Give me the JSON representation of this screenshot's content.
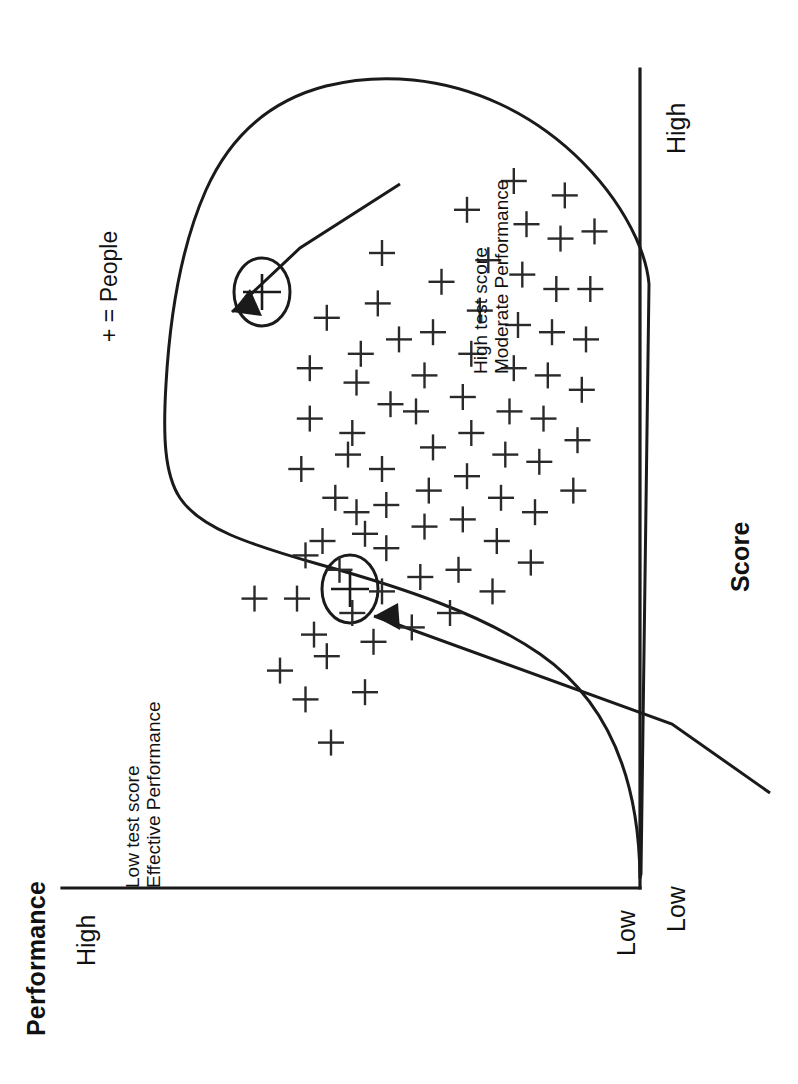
{
  "figure": {
    "orientation": "rotated-90-ccw",
    "background": "#ffffff",
    "ink_color": "#1a1a1a"
  },
  "axes": {
    "y_title": "Performance",
    "x_title": "Score",
    "y_ticks": [
      "High",
      "Low"
    ],
    "x_ticks": [
      "Low",
      "High"
    ]
  },
  "legend": {
    "marker": "+",
    "text": "+ = People"
  },
  "annotations": [
    {
      "id": "low-test-score",
      "line1": "Low test score",
      "line2": "Effective Performance",
      "text": "Low test score\nEffective Performance"
    },
    {
      "id": "high-test-score",
      "line1": "High test score",
      "line2": "Moderate Performance",
      "text": "High test score\nModerate Performance"
    }
  ],
  "chart_data": {
    "type": "scatter",
    "title": "",
    "xlabel": "Score",
    "ylabel": "Performance",
    "xlim": [
      0,
      1
    ],
    "ylim": [
      0,
      1
    ],
    "xtick_labels": [
      "Low",
      "High"
    ],
    "ytick_labels": [
      "Low",
      "High"
    ],
    "grid": false,
    "legend": "+ = People",
    "marker": "plus",
    "series": [
      {
        "name": "People",
        "marker": "+",
        "points": [
          [
            0.32,
            0.86
          ],
          [
            0.22,
            0.8
          ],
          [
            0.32,
            0.76
          ],
          [
            0.38,
            0.74
          ],
          [
            0.5,
            0.75
          ],
          [
            0.57,
            0.73
          ],
          [
            0.12,
            0.68
          ],
          [
            0.24,
            0.69
          ],
          [
            0.36,
            0.66
          ],
          [
            0.4,
            0.7
          ],
          [
            0.46,
            0.67
          ],
          [
            0.64,
            0.73
          ],
          [
            0.71,
            0.69
          ],
          [
            0.19,
            0.6
          ],
          [
            0.26,
            0.58
          ],
          [
            0.33,
            0.56
          ],
          [
            0.39,
            0.55
          ],
          [
            0.45,
            0.55
          ],
          [
            0.5,
            0.56
          ],
          [
            0.55,
            0.63
          ],
          [
            0.62,
            0.62
          ],
          [
            0.66,
            0.61
          ],
          [
            0.73,
            0.57
          ],
          [
            0.8,
            0.56
          ],
          [
            0.28,
            0.49
          ],
          [
            0.35,
            0.47
          ],
          [
            0.42,
            0.46
          ],
          [
            0.47,
            0.45
          ],
          [
            0.53,
            0.44
          ],
          [
            0.58,
            0.48
          ],
          [
            0.63,
            0.46
          ],
          [
            0.69,
            0.44
          ],
          [
            0.76,
            0.42
          ],
          [
            0.3,
            0.4
          ],
          [
            0.36,
            0.38
          ],
          [
            0.43,
            0.37
          ],
          [
            0.49,
            0.36
          ],
          [
            0.55,
            0.35
          ],
          [
            0.6,
            0.37
          ],
          [
            0.66,
            0.35
          ],
          [
            0.72,
            0.33
          ],
          [
            0.79,
            0.31
          ],
          [
            0.33,
            0.3
          ],
          [
            0.4,
            0.29
          ],
          [
            0.46,
            0.28
          ],
          [
            0.52,
            0.27
          ],
          [
            0.58,
            0.26
          ],
          [
            0.64,
            0.25
          ],
          [
            0.7,
            0.24
          ],
          [
            0.77,
            0.23
          ],
          [
            0.84,
            0.22
          ],
          [
            0.37,
            0.21
          ],
          [
            0.44,
            0.2
          ],
          [
            0.51,
            0.19
          ],
          [
            0.57,
            0.18
          ],
          [
            0.63,
            0.17
          ],
          [
            0.69,
            0.16
          ],
          [
            0.75,
            0.15
          ],
          [
            0.82,
            0.14
          ],
          [
            0.88,
            0.13
          ],
          [
            0.47,
            0.11
          ],
          [
            0.54,
            0.1
          ],
          [
            0.61,
            0.09
          ],
          [
            0.68,
            0.08
          ],
          [
            0.75,
            0.07
          ],
          [
            0.83,
            0.06
          ],
          [
            0.41,
            0.6
          ],
          [
            0.59,
            0.54
          ],
          [
            0.44,
            0.62
          ],
          [
            0.68,
            0.52
          ],
          [
            0.86,
            0.36
          ],
          [
            0.9,
            0.25
          ],
          [
            0.52,
            0.64
          ],
          [
            0.3,
            0.63
          ],
          [
            0.27,
            0.72
          ],
          [
            0.18,
            0.74
          ]
        ]
      }
    ],
    "highlighted_points": [
      {
        "label": "Low test score / Effective Performance",
        "x": 0.26,
        "y": 0.38,
        "circled": true
      },
      {
        "label": "High test score / Moderate Performance",
        "x": 0.74,
        "y": 0.7,
        "circled": true
      }
    ],
    "envelope": "hand-drawn closed blob enclosing all data points"
  }
}
